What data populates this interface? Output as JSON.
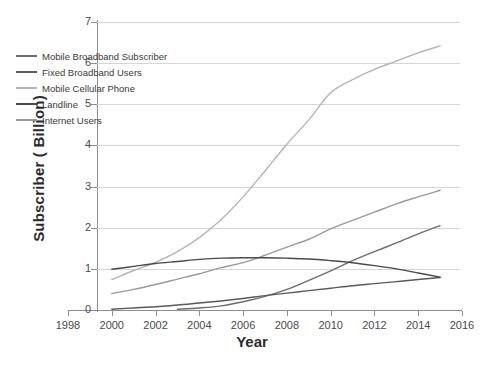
{
  "chart_data": {
    "type": "line",
    "title": "",
    "xlabel": "Year",
    "ylabel": "Subscriber ( Billion)",
    "xlim": [
      1998,
      2016
    ],
    "ylim": [
      0,
      7
    ],
    "xticks": [
      1998,
      2000,
      2002,
      2004,
      2006,
      2008,
      2010,
      2012,
      2014,
      2016
    ],
    "yticks": [
      0,
      1,
      2,
      3,
      4,
      5,
      6,
      7
    ],
    "grid": "horizontal",
    "legend_position": "upper-left-inside",
    "series": [
      {
        "name": "Mobile Broadband Subscriber",
        "color": "#6d6d6d",
        "x": [
          2003,
          2004,
          2005,
          2006,
          2007,
          2008,
          2009,
          2010,
          2011,
          2012,
          2013,
          2014,
          2015
        ],
        "values": [
          0.02,
          0.05,
          0.1,
          0.2,
          0.33,
          0.5,
          0.72,
          0.95,
          1.2,
          1.42,
          1.63,
          1.85,
          2.05
        ]
      },
      {
        "name": "Fixed Broadband Users",
        "color": "#5a5a5a",
        "x": [
          2000,
          2001,
          2002,
          2003,
          2004,
          2005,
          2006,
          2007,
          2008,
          2009,
          2010,
          2011,
          2012,
          2013,
          2014,
          2015
        ],
        "values": [
          0.02,
          0.05,
          0.08,
          0.12,
          0.17,
          0.22,
          0.28,
          0.35,
          0.41,
          0.47,
          0.53,
          0.59,
          0.64,
          0.69,
          0.74,
          0.79
        ]
      },
      {
        "name": "Mobile Cellular Phone",
        "color": "#b4b4b4",
        "x": [
          2000,
          2001,
          2002,
          2003,
          2004,
          2005,
          2006,
          2007,
          2008,
          2009,
          2010,
          2011,
          2012,
          2013,
          2014,
          2015
        ],
        "values": [
          0.74,
          0.96,
          1.16,
          1.42,
          1.76,
          2.2,
          2.75,
          3.38,
          4.03,
          4.62,
          5.28,
          5.6,
          5.85,
          6.05,
          6.25,
          6.42
        ]
      },
      {
        "name": "Landline",
        "color": "#4a4a4a",
        "x": [
          2000,
          2001,
          2002,
          2003,
          2004,
          2005,
          2006,
          2007,
          2008,
          2009,
          2010,
          2011,
          2012,
          2013,
          2014,
          2015
        ],
        "values": [
          0.99,
          1.06,
          1.13,
          1.18,
          1.23,
          1.26,
          1.27,
          1.27,
          1.26,
          1.24,
          1.2,
          1.15,
          1.08,
          1.0,
          0.9,
          0.8
        ]
      },
      {
        "name": "Internet Users",
        "color": "#9a9a9a",
        "x": [
          2000,
          2001,
          2002,
          2003,
          2004,
          2005,
          2006,
          2007,
          2008,
          2009,
          2010,
          2011,
          2012,
          2013,
          2014,
          2015
        ],
        "values": [
          0.4,
          0.5,
          0.62,
          0.75,
          0.88,
          1.03,
          1.15,
          1.33,
          1.53,
          1.72,
          1.97,
          2.18,
          2.38,
          2.58,
          2.75,
          2.91
        ]
      }
    ]
  }
}
